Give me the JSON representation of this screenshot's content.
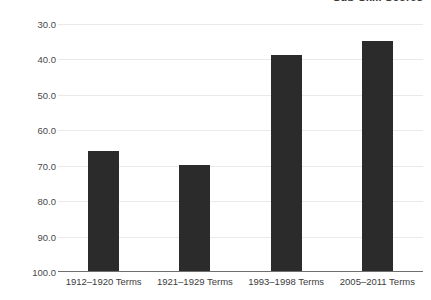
{
  "chart_data": {
    "type": "bar",
    "title": "Sub-Skill Scores",
    "subtitle": "",
    "xlabel": "",
    "ylabel": "",
    "categories": [
      "1912–1920 Terms",
      "1921–1929 Terms",
      "1993–1998 Terms",
      "2005–2011 Terms"
    ],
    "values": [
      64.2,
      60.2,
      91.3,
      95.2
    ],
    "ylim": [
      30.0,
      100.0
    ],
    "yticks": [
      30.0,
      40.0,
      50.0,
      60.0,
      70.0,
      80.0,
      90.0,
      100.0
    ],
    "ytick_labels": [
      "30.0",
      "40.0",
      "50.0",
      "60.0",
      "70.0",
      "80.0",
      "90.0",
      "100.0"
    ],
    "grid": true,
    "legend": "none",
    "bar_color": "#2b2b2b",
    "grid_color": "#e9e9ec",
    "axis_color": "#6f6f6f",
    "background_color": "#ffffff"
  },
  "axes": {
    "y_labels": [
      "100.0",
      "90.0",
      "80.0",
      "70.0",
      "60.0",
      "50.0",
      "40.0",
      "30.0"
    ],
    "x_labels": [
      "1912–1920 Terms",
      "1921–1929 Terms",
      "1993–1998 Terms",
      "2005–2011 Terms"
    ]
  }
}
